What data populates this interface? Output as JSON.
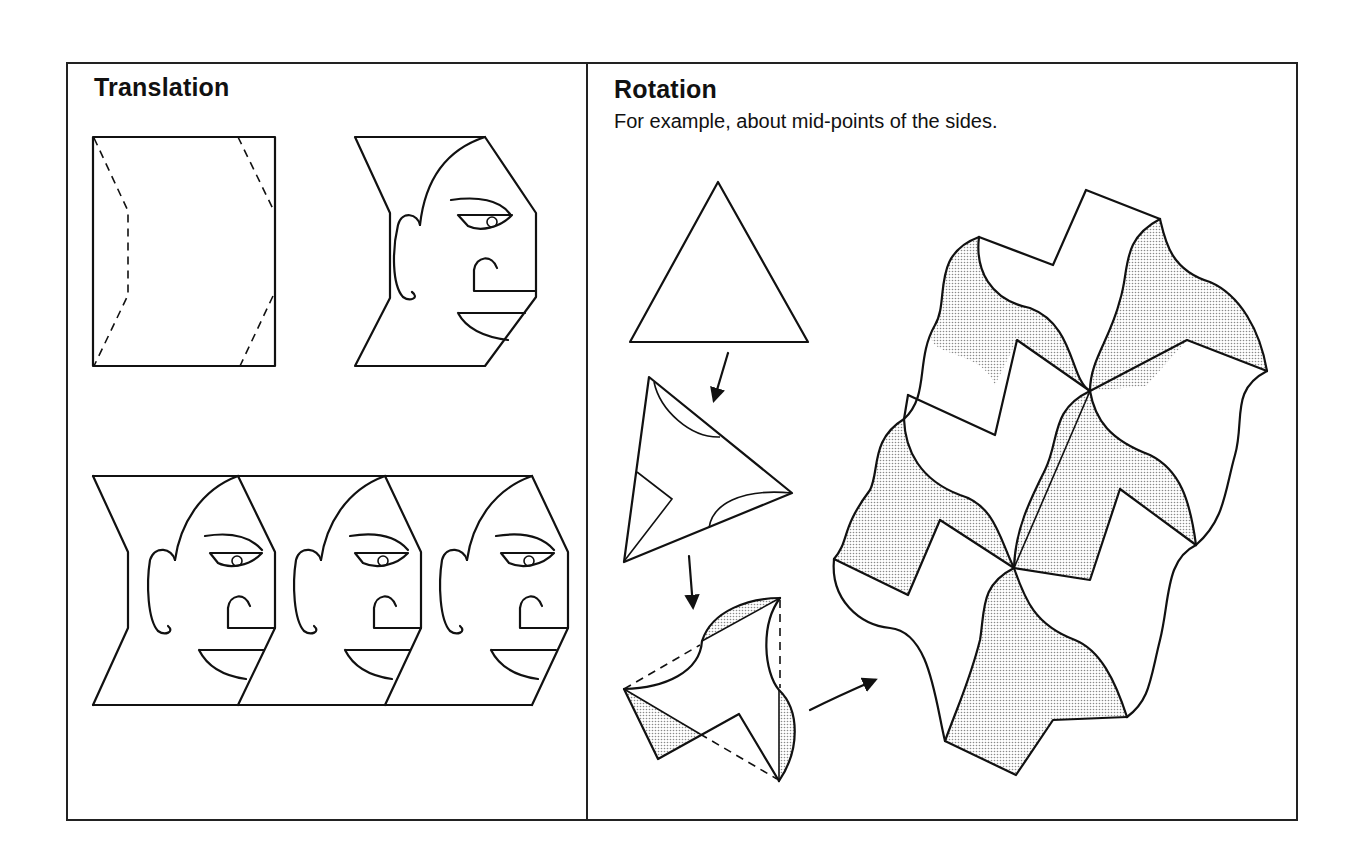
{
  "panels": {
    "translation": {
      "title": "Translation",
      "figures": [
        "rectangle-with-dashed-cut-lines",
        "face-tile",
        "translated-face-strip"
      ],
      "strip_count": 3
    },
    "rotation": {
      "title": "Rotation",
      "subtitle": "For example, about mid-points of the sides.",
      "figures": [
        "equilateral-triangle",
        "triangle-with-arc-cuts",
        "rotated-shaded-tile",
        "rotation-tessellation"
      ]
    }
  },
  "colors": {
    "line": "#111111",
    "background": "#ffffff",
    "shade": "#bdbdbd"
  }
}
